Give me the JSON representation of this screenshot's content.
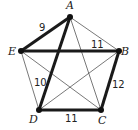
{
  "diagram": {
    "type": "weighted-graph",
    "vertices": [
      {
        "id": "A",
        "label": "A",
        "x": 70,
        "y": 17,
        "lx": 66,
        "ly": 9
      },
      {
        "id": "B",
        "label": "B",
        "x": 119,
        "y": 51,
        "lx": 121,
        "ly": 55
      },
      {
        "id": "C",
        "label": "C",
        "x": 101,
        "y": 110,
        "lx": 98,
        "ly": 124
      },
      {
        "id": "D",
        "label": "D",
        "x": 39,
        "y": 110,
        "lx": 29,
        "ly": 123
      },
      {
        "id": "E",
        "label": "E",
        "x": 21,
        "y": 51,
        "lx": 8,
        "ly": 55
      }
    ],
    "edges": [
      {
        "from": "A",
        "to": "E",
        "weight": "9",
        "highlighted": true,
        "wx": 39,
        "wy": 31
      },
      {
        "from": "E",
        "to": "B",
        "weight": "11",
        "highlighted": true,
        "wx": 91,
        "wy": 48
      },
      {
        "from": "A",
        "to": "D",
        "weight": "10",
        "highlighted": true,
        "wx": 34,
        "wy": 86
      },
      {
        "from": "D",
        "to": "C",
        "weight": "11",
        "highlighted": true,
        "wx": 65,
        "wy": 122
      },
      {
        "from": "B",
        "to": "C",
        "weight": "12",
        "highlighted": true,
        "wx": 112,
        "wy": 88
      },
      {
        "from": "A",
        "to": "B",
        "weight": "",
        "highlighted": false
      },
      {
        "from": "A",
        "to": "C",
        "weight": "",
        "highlighted": false
      },
      {
        "from": "E",
        "to": "D",
        "weight": "",
        "highlighted": false
      },
      {
        "from": "E",
        "to": "C",
        "weight": "",
        "highlighted": false
      },
      {
        "from": "D",
        "to": "B",
        "weight": "",
        "highlighted": false
      }
    ],
    "colors": {
      "line": "#1a1a1a",
      "thin_line": "#555555",
      "vertex": "#111111"
    }
  }
}
